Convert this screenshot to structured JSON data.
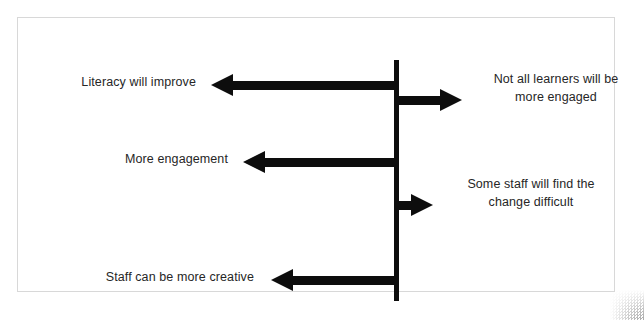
{
  "diagram": {
    "type": "force-field-analysis",
    "title": "",
    "spine": {
      "name": "central-dividing-line",
      "orientation": "vertical",
      "color": "#0d0d0d"
    },
    "arrow_color": "#0d0d0d",
    "text_color": "#262626",
    "background": "#ffffff",
    "frame_color": "#9a9a9a",
    "left_forces": [
      {
        "id": "literacy-will-improve",
        "label": "Literacy will improve",
        "direction": "left",
        "arrow_length_px": 183,
        "y_px": 63
      },
      {
        "id": "more-engagement",
        "label": "More engagement",
        "direction": "left",
        "arrow_length_px": 151,
        "y_px": 140
      },
      {
        "id": "staff-can-be-more-creative",
        "label": "Staff can be more creative",
        "direction": "left",
        "arrow_length_px": 123,
        "y_px": 258
      }
    ],
    "right_forces": [
      {
        "id": "not-all-learners-will-be-more-engaged",
        "label": "Not all learners will be\nmore engaged",
        "direction": "right",
        "arrow_length_px": 66,
        "y_px": 78
      },
      {
        "id": "some-staff-will-find-the-change-difficult",
        "label": "Some staff will find the\nchange difficult",
        "direction": "right",
        "arrow_length_px": 37,
        "y_px": 183
      }
    ]
  }
}
